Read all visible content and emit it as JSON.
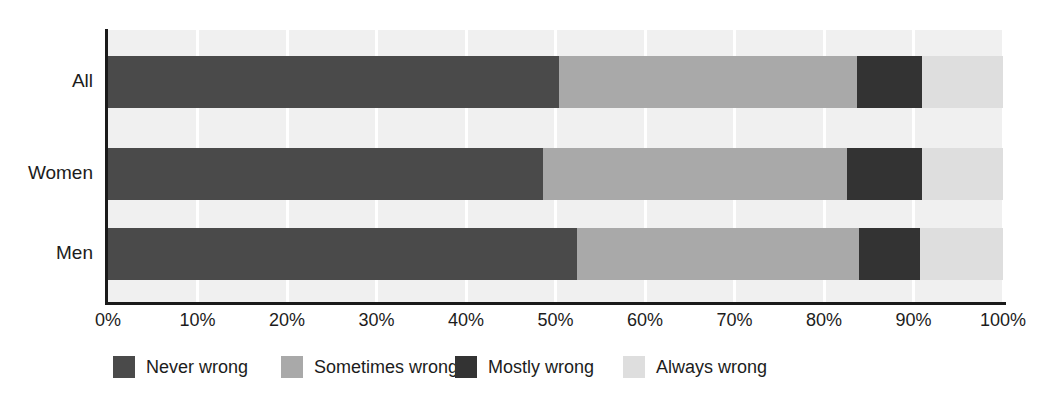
{
  "chart_data": {
    "type": "bar",
    "orientation": "horizontal",
    "stacked": true,
    "stack_mode": "percent",
    "title": "",
    "subtitle": "",
    "xlabel": "",
    "ylabel": "",
    "xlim": [
      0,
      100
    ],
    "xticks": [
      0,
      10,
      20,
      30,
      40,
      50,
      60,
      70,
      80,
      90,
      100
    ],
    "xtick_labels": [
      "0%",
      "10%",
      "20%",
      "30%",
      "40%",
      "50%",
      "60%",
      "70%",
      "80%",
      "90%",
      "100%"
    ],
    "grid": "vertical-white-on-light-gray",
    "legend_position": "bottom-left",
    "categories": [
      "All",
      "Women",
      "Men"
    ],
    "series": [
      {
        "name": "Never wrong",
        "color": "#4a4a4a",
        "values": [
          50.4,
          48.6,
          52.4
        ]
      },
      {
        "name": "Sometimes wrong",
        "color": "#a9a9a9",
        "values": [
          33.3,
          34.0,
          31.5
        ]
      },
      {
        "name": "Mostly wrong",
        "color": "#333333",
        "values": [
          7.2,
          8.3,
          6.8
        ]
      },
      {
        "name": "Always wrong",
        "color": "#dedede",
        "values": [
          9.1,
          9.1,
          9.3
        ]
      }
    ]
  },
  "colors": {
    "plot_background": "#f0f0f0",
    "gridline": "#ffffff",
    "axis": "#1a1a1a",
    "text": "#1c1c1c",
    "page_background": "#ffffff"
  }
}
